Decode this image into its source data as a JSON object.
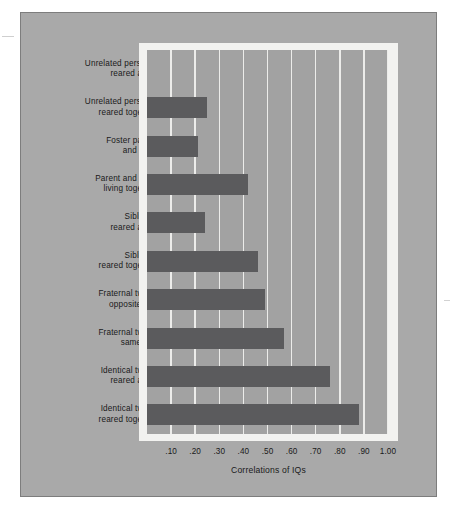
{
  "chart_data": {
    "type": "bar",
    "orientation": "horizontal",
    "title": "",
    "xlabel": "Correlations of IQs",
    "ylabel": "",
    "xlim": [
      0,
      1.0
    ],
    "xticks": [
      0.1,
      0.2,
      0.3,
      0.4,
      0.5,
      0.6,
      0.7,
      0.8,
      0.9,
      1.0
    ],
    "xtick_labels": [
      ".10",
      ".20",
      ".30",
      ".40",
      ".50",
      ".60",
      ".70",
      ".80",
      ".90",
      "1.00"
    ],
    "grid": "vertical",
    "legend": "none",
    "categories": [
      "Unrelated persons, reared apart",
      "Unrelated persons, reared together",
      "Foster parent and child",
      "Parent and child living together",
      "Siblings, reared apart",
      "Siblings, reared together",
      "Fraternal twins, opposite sex",
      "Fraternal twins, same sex",
      "Identical twins, reared apart",
      "Identical twins, reared together"
    ],
    "category_lines": [
      [
        "Unrelated persons,",
        "reared apart"
      ],
      [
        "Unrelated persons,",
        "reared together"
      ],
      [
        "Foster parent",
        "and child"
      ],
      [
        "Parent and child",
        "living together"
      ],
      [
        "Siblings,",
        "reared apart"
      ],
      [
        "Siblings,",
        "reared together"
      ],
      [
        "Fraternal twins,",
        "opposite sex"
      ],
      [
        "Fraternal twins,",
        "same sex"
      ],
      [
        "Identical twins,",
        "reared apart"
      ],
      [
        "Identical twins,",
        "reared together"
      ]
    ],
    "values": [
      0.0,
      0.25,
      0.21,
      0.42,
      0.24,
      0.46,
      0.49,
      0.57,
      0.76,
      0.88
    ]
  },
  "style": {
    "panel_background": "#a9a9a9",
    "plot_background": "#a2a2a2",
    "frame_color": "#f2f2f0",
    "bar_color": "#5b5b5d",
    "gridline_color": "#ececea",
    "text_color": "#19191a",
    "border_color": "#7d7d7d"
  }
}
